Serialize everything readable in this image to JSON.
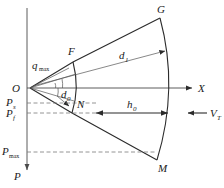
{
  "figure": {
    "type": "geometry-diagram",
    "background_color": "#ffffff",
    "line_color": "#2b2b2b",
    "dash_color": "#7a7a7a"
  },
  "axes": {
    "x_label": "X",
    "p_label": "P",
    "origin_label": "O"
  },
  "points": {
    "origin": "O",
    "upper_inner": "F",
    "upper_outer": "G",
    "lower_inner": "N",
    "lower_outer": "M"
  },
  "dimensions": {
    "angle_max": "q",
    "angle_max_sub": "max",
    "d_outer": "d",
    "d_outer_sub": "1",
    "d_inner": "d",
    "d_inner_sub": "0",
    "h_label": "h",
    "h_sub": "0"
  },
  "p_levels": [
    {
      "symbol": "P",
      "subscript": "s"
    },
    {
      "symbol": "P",
      "subscript": "f"
    },
    {
      "symbol": "P",
      "subscript": "max"
    }
  ],
  "velocity": {
    "symbol": "V",
    "subscript": "T"
  }
}
